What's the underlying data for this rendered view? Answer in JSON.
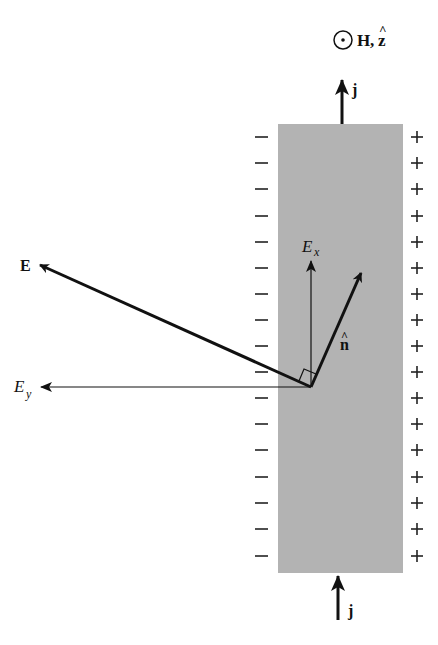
{
  "figure": {
    "field_label": {
      "symbol": "⊙",
      "text": "H, ẑ",
      "H": "H",
      "comma": ",",
      "z": "z",
      "hat": "^"
    },
    "current_top": {
      "label": "j"
    },
    "current_bottom": {
      "label": "j"
    },
    "strip": {
      "fill": "#b3b3b3",
      "x": 278,
      "y": 124,
      "width": 125,
      "height": 449
    },
    "left_charges": {
      "sign": "−",
      "count": 17
    },
    "right_charges": {
      "sign": "+",
      "count": 17
    },
    "vectors": {
      "E": {
        "label": "E"
      },
      "Ex": {
        "label": "E",
        "subscript": "x"
      },
      "Ey": {
        "label": "E",
        "subscript": "y"
      },
      "n_hat": {
        "label": "n",
        "hat": "^"
      }
    },
    "colors": {
      "ink": "#111111",
      "strip": "#b3b3b3",
      "background": "#ffffff"
    }
  }
}
